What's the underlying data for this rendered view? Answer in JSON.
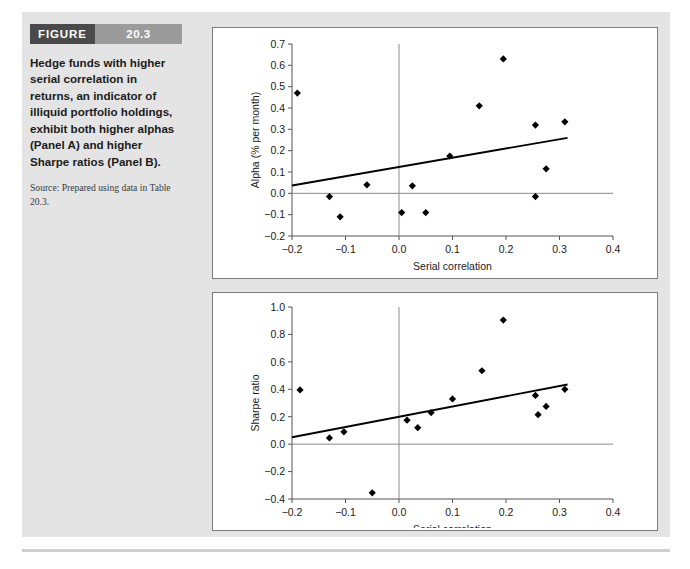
{
  "figure": {
    "header_word": "FIGURE",
    "header_number": "20.3",
    "caption": "Hedge funds with higher serial correlation in returns, an indicator of illiquid portfolio holdings, exhibit both higher alphas (Panel A) and higher Sharpe ratios (Panel B).",
    "source": "Source: Prepared using data in Table 20.3.",
    "colors": {
      "header_word_bg": "#4a4a4a",
      "header_number_bg": "#9b9b9b",
      "panel_bg": "#e4e4e4",
      "chart_bg": "#ffffff",
      "marker": "#000000",
      "trend": "#000000"
    }
  },
  "panels": [
    {
      "id": "A",
      "label": "(A)"
    },
    {
      "id": "B",
      "label": "(B)"
    }
  ],
  "chart_data": [
    {
      "type": "scatter",
      "panel": "A",
      "title": "",
      "xlabel": "Serial correlation",
      "ylabel": "Alpha (% per month)",
      "xlim": [
        -0.2,
        0.4
      ],
      "ylim": [
        -0.2,
        0.7
      ],
      "xticks": [
        -0.2,
        -0.1,
        0.0,
        0.1,
        0.2,
        0.3,
        0.4
      ],
      "xticklabels": [
        "−0.2",
        "−0.1",
        "0.0",
        "0.1",
        "0.2",
        "0.3",
        "0.4"
      ],
      "yticks": [
        -0.2,
        -0.1,
        0.0,
        0.1,
        0.2,
        0.3,
        0.4,
        0.5,
        0.6,
        0.7
      ],
      "yticklabels": [
        "−0.2",
        "−0.1",
        "0.0",
        "0.1",
        "0.2",
        "0.3",
        "0.4",
        "0.5",
        "0.6",
        "0.7"
      ],
      "grid": false,
      "legend": "none",
      "zero_line_y": 0.0,
      "vertical_line_x": 0.0,
      "points": [
        {
          "x": -0.19,
          "y": 0.47
        },
        {
          "x": -0.13,
          "y": -0.015
        },
        {
          "x": -0.11,
          "y": -0.11
        },
        {
          "x": -0.06,
          "y": 0.04
        },
        {
          "x": 0.005,
          "y": -0.09
        },
        {
          "x": 0.025,
          "y": 0.035
        },
        {
          "x": 0.05,
          "y": -0.09
        },
        {
          "x": 0.095,
          "y": 0.175
        },
        {
          "x": 0.15,
          "y": 0.41
        },
        {
          "x": 0.195,
          "y": 0.63
        },
        {
          "x": 0.255,
          "y": 0.32
        },
        {
          "x": 0.255,
          "y": -0.015
        },
        {
          "x": 0.275,
          "y": 0.115
        },
        {
          "x": 0.31,
          "y": 0.335
        }
      ],
      "trendline": {
        "x0": -0.2,
        "y0": 0.037,
        "x1": 0.315,
        "y1": 0.26
      }
    },
    {
      "type": "scatter",
      "panel": "B",
      "title": "",
      "xlabel": "Serial correlation",
      "ylabel": "Sharpe ratio",
      "xlim": [
        -0.2,
        0.4
      ],
      "ylim": [
        -0.4,
        1.0
      ],
      "xticks": [
        -0.2,
        -0.1,
        0.0,
        0.1,
        0.2,
        0.3,
        0.4
      ],
      "xticklabels": [
        "−0.2",
        "−0.1",
        "0.0",
        "0.1",
        "0.2",
        "0.3",
        "0.4"
      ],
      "yticks": [
        -0.4,
        -0.2,
        0.0,
        0.2,
        0.4,
        0.6,
        0.8,
        1.0
      ],
      "yticklabels": [
        "−0.4",
        "−0.2",
        "0.0",
        "0.2",
        "0.4",
        "0.6",
        "0.8",
        "1.0"
      ],
      "grid": false,
      "legend": "none",
      "zero_line_y": 0.0,
      "vertical_line_x": 0.0,
      "points": [
        {
          "x": -0.185,
          "y": 0.395
        },
        {
          "x": -0.13,
          "y": 0.045
        },
        {
          "x": -0.103,
          "y": 0.09
        },
        {
          "x": -0.05,
          "y": -0.355
        },
        {
          "x": 0.015,
          "y": 0.175
        },
        {
          "x": 0.035,
          "y": 0.12
        },
        {
          "x": 0.06,
          "y": 0.23
        },
        {
          "x": 0.1,
          "y": 0.33
        },
        {
          "x": 0.155,
          "y": 0.535
        },
        {
          "x": 0.195,
          "y": 0.905
        },
        {
          "x": 0.255,
          "y": 0.355
        },
        {
          "x": 0.26,
          "y": 0.215
        },
        {
          "x": 0.275,
          "y": 0.275
        },
        {
          "x": 0.31,
          "y": 0.4
        }
      ],
      "trendline": {
        "x0": -0.2,
        "y0": 0.05,
        "x1": 0.315,
        "y1": 0.435
      }
    }
  ]
}
